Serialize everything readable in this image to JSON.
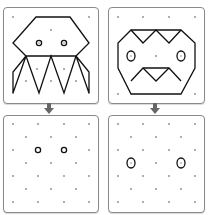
{
  "caption": "",
  "panels": [
    {
      "id": "top-left",
      "label": "octopus-figure"
    },
    {
      "id": "top-right",
      "label": "face-figure"
    },
    {
      "id": "bottom-left",
      "label": "dot-grid-with-two-eyes"
    },
    {
      "id": "bottom-right",
      "label": "dot-grid-with-two-eyes"
    }
  ],
  "colors": {
    "line": "#111111",
    "dot": "#777777",
    "border": "#8a8a8a",
    "arrow": "#666666"
  }
}
